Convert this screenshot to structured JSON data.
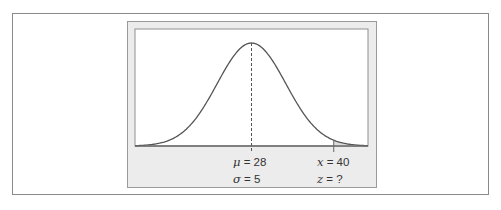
{
  "figure": {
    "mu_label": "μ = 28",
    "sigma_label": "σ = 5",
    "x_label": "x = 40",
    "z_label": "z = ?",
    "mu_symbol": "μ",
    "mu_value": "= 28",
    "sigma_symbol": "σ",
    "sigma_value": "= 5",
    "x_symbol": "x",
    "x_value": "= 40",
    "z_symbol": "z",
    "z_value": "= ?"
  },
  "colors": {
    "frame_border": "#8a8a8a",
    "panel_fill": "#ececec",
    "plot_fill": "#ffffff",
    "curve": "#555555",
    "shaded_tail": "#dcdcdc",
    "text": "#333333"
  },
  "chart_data": {
    "type": "area",
    "title": "",
    "distribution": "normal",
    "mean": 28,
    "std_dev": 5,
    "x_marker": 40,
    "z_value": "?",
    "shaded_region": {
      "from": 40,
      "to": "right tail"
    },
    "xlim": [
      11,
      45
    ],
    "annotations": [
      "μ = 28",
      "σ = 5",
      "x = 40",
      "z = ?"
    ],
    "mean_line": "dashed vertical at μ",
    "grid": false,
    "legend": null,
    "xlabel": "",
    "ylabel": ""
  }
}
